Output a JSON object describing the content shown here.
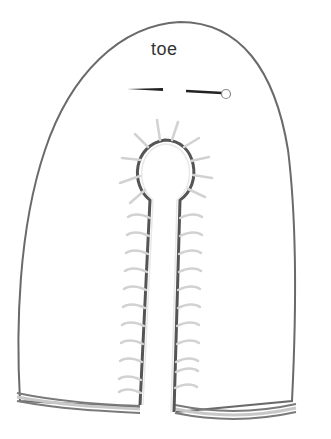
{
  "diagram": {
    "type": "sewing pattern piece",
    "label": "toe",
    "colors": {
      "outline": "#6a6a6a",
      "stitch": "#d0d0d0",
      "seam_shadow": "#555555",
      "hem_band": "#8a8a8a",
      "hem_band_light": "#c8c8c8",
      "marker": "#222222"
    },
    "markers": {
      "left_dash": "placement line (left)",
      "right_dash": "placement line with circle end (right)"
    },
    "stitch_counts": {
      "ring": 10,
      "left_slit": 12,
      "right_slit": 12
    }
  }
}
